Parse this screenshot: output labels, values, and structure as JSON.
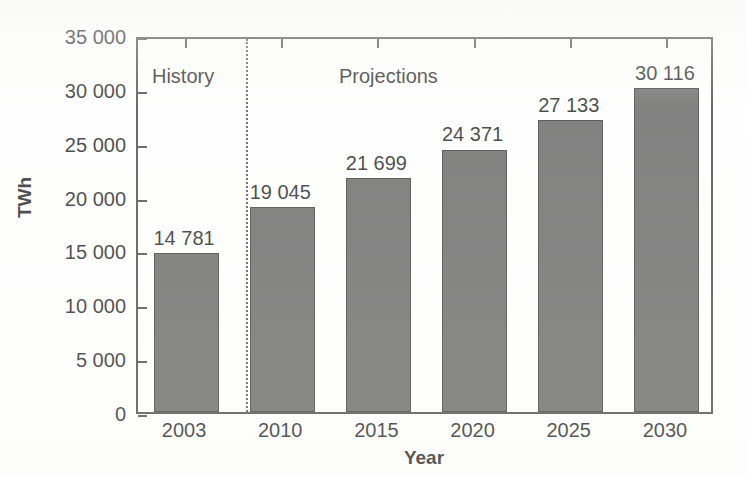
{
  "chart_data": {
    "type": "bar",
    "title": "",
    "xlabel": "Year",
    "ylabel": "TWh",
    "categories": [
      "2003",
      "2010",
      "2015",
      "2020",
      "2025",
      "2030"
    ],
    "values": [
      14781,
      19045,
      21699,
      24371,
      27133,
      30116
    ],
    "value_labels": [
      "14 781",
      "19 045",
      "21 699",
      "24 371",
      "27 133",
      "30 116"
    ],
    "ylim": [
      0,
      35000
    ],
    "ytick_values": [
      0,
      5000,
      10000,
      15000,
      20000,
      25000,
      30000,
      35000
    ],
    "ytick_labels": [
      "0",
      "5 000",
      "10 000",
      "15 000",
      "20 000",
      "25 000",
      "30 000",
      "35 000"
    ],
    "grid": false,
    "legend": "none",
    "bar_color": "#595959",
    "bar_edge_color": "#2b2b2b",
    "axis_color": "#3a3a3a",
    "text_color": "#111111",
    "annotations": [
      {
        "text": "History",
        "x_category": "2003",
        "note": "left of divider"
      },
      {
        "text": "Projections",
        "x_category": "2015",
        "note": "right of divider"
      }
    ],
    "divider": {
      "style": "dotted",
      "between": [
        "2003",
        "2010"
      ],
      "label_left": "History",
      "label_right": "Projections"
    }
  },
  "axes": {
    "y_title": "TWh",
    "x_title": "Year"
  }
}
